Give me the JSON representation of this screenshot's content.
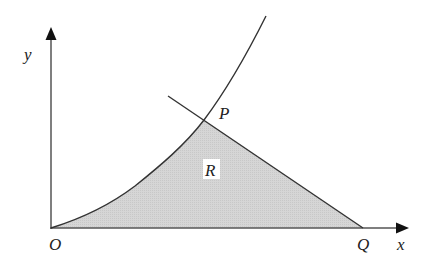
{
  "diagram": {
    "axes": {
      "x_label": "x",
      "y_label": "y",
      "origin_label": "O"
    },
    "points": {
      "P": "P",
      "Q": "Q"
    },
    "region": {
      "label": "R",
      "fill": "#d3d3d3"
    },
    "colors": {
      "stroke": "#333333",
      "axis": "#555555",
      "fill": "#d3d3d3"
    }
  }
}
